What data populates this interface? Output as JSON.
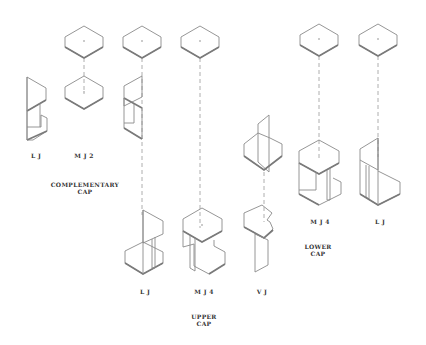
{
  "labels": {
    "lj_1": "L J",
    "mj2": "M J 2",
    "complementary_cap": "COMPLEMENTARY\nCAP",
    "lj_2": "L J",
    "mj4_upper": "M J 4",
    "vj": "V J",
    "upper_cap": "UPPER\nCAP",
    "mj4_lower": "M J 4",
    "lj_3": "L J",
    "lower_cap": "LOWER\nCAP"
  },
  "colors": {
    "background": "#ffffff",
    "line": "#8a8a8a",
    "text": "#333333"
  }
}
